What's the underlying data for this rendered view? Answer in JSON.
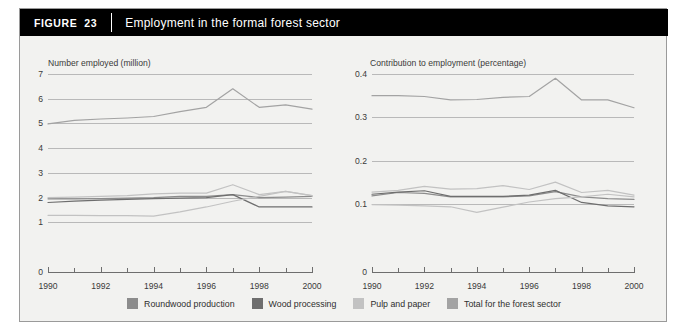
{
  "figure": {
    "tag": "FIGURE",
    "number": "23",
    "title": "Employment in the formal forest sector"
  },
  "legend": {
    "items": [
      {
        "label": "Roundwood production",
        "color": "#8c8c8c"
      },
      {
        "label": "Wood processing",
        "color": "#6e6e6e"
      },
      {
        "label": "Pulp and paper",
        "color": "#c2c2c2"
      },
      {
        "label": "Total for the forest sector",
        "color": "#a3a3a3"
      }
    ]
  },
  "chart_data": [
    {
      "type": "line",
      "id": "number-employed",
      "title": "Number employed (million)",
      "xlabel": "",
      "ylabel": "Number employed (million)",
      "x": [
        1990,
        1991,
        1992,
        1993,
        1994,
        1995,
        1996,
        1997,
        1998,
        1999,
        2000
      ],
      "xlim": [
        1990,
        2000
      ],
      "ylim": [
        0,
        7
      ],
      "yticks": [
        0,
        1,
        2,
        3,
        4,
        5,
        6,
        7
      ],
      "xticks": [
        1990,
        1991,
        1992,
        1993,
        1994,
        1995,
        1996,
        1997,
        1998,
        1999,
        2000
      ],
      "xticklabels": [
        "1990",
        "",
        "1992",
        "",
        "1994",
        "",
        "1996",
        "",
        "1998",
        "",
        "2000"
      ],
      "grid": true,
      "series": [
        {
          "name": "Roundwood production",
          "color": "#8c8c8c",
          "values": [
            1.95,
            1.95,
            1.96,
            1.98,
            2.0,
            2.05,
            2.05,
            2.12,
            2.0,
            2.02,
            2.05
          ]
        },
        {
          "name": "Wood processing",
          "color": "#6e6e6e",
          "values": [
            1.8,
            1.86,
            1.9,
            1.93,
            1.96,
            1.98,
            2.0,
            2.12,
            1.62,
            1.62,
            1.62
          ]
        },
        {
          "name": "Pulp and paper",
          "color": "#c2c2c2",
          "values": [
            1.28,
            1.28,
            1.27,
            1.27,
            1.25,
            1.42,
            1.62,
            1.85,
            2.05,
            2.25,
            2.08
          ]
        },
        {
          "name": "Total for the forest sector",
          "color": "#a3a3a3",
          "values": [
            4.98,
            5.12,
            5.18,
            5.22,
            5.28,
            5.48,
            5.65,
            6.4,
            5.65,
            5.75,
            5.58
          ]
        }
      ],
      "secondary_cluster": [
        {
          "name": "Pulp and paper upper",
          "color": "#c2c2c2",
          "values": [
            2.0,
            2.02,
            2.05,
            2.08,
            2.15,
            2.18,
            2.18,
            2.52,
            2.12,
            2.25,
            2.08
          ]
        }
      ]
    },
    {
      "type": "line",
      "id": "contribution-to-employment",
      "title": "Contribution to employment (percentage)",
      "xlabel": "",
      "ylabel": "Contribution to employment (percentage)",
      "x": [
        1990,
        1991,
        1992,
        1993,
        1994,
        1995,
        1996,
        1997,
        1998,
        1999,
        2000
      ],
      "xlim": [
        1990,
        2000
      ],
      "ylim": [
        0,
        0.4
      ],
      "yticks": [
        0,
        0.1,
        0.2,
        0.3,
        0.4
      ],
      "xticks": [
        1990,
        1991,
        1992,
        1993,
        1994,
        1995,
        1996,
        1997,
        1998,
        1999,
        2000
      ],
      "xticklabels": [
        "1990",
        "",
        "1992",
        "",
        "1994",
        "",
        "1996",
        "",
        "1998",
        "",
        "2000"
      ],
      "grid": true,
      "series": [
        {
          "name": "Roundwood production",
          "color": "#8c8c8c",
          "values": [
            0.118,
            0.126,
            0.124,
            0.116,
            0.116,
            0.116,
            0.118,
            0.128,
            0.116,
            0.112,
            0.11
          ]
        },
        {
          "name": "Wood processing",
          "color": "#6e6e6e",
          "values": [
            0.122,
            0.127,
            0.13,
            0.117,
            0.117,
            0.117,
            0.12,
            0.131,
            0.103,
            0.095,
            0.093
          ]
        },
        {
          "name": "Pulp and paper",
          "color": "#c2c2c2",
          "values": [
            0.098,
            0.097,
            0.095,
            0.093,
            0.08,
            0.092,
            0.104,
            0.112,
            0.116,
            0.122,
            0.116
          ]
        },
        {
          "name": "Total for the forest sector",
          "color": "#a3a3a3",
          "values": [
            0.35,
            0.35,
            0.348,
            0.34,
            0.341,
            0.346,
            0.348,
            0.39,
            0.34,
            0.34,
            0.322
          ]
        }
      ],
      "secondary_cluster": [
        {
          "name": "Pulp and paper upper",
          "color": "#c2c2c2",
          "values": [
            0.127,
            0.131,
            0.14,
            0.134,
            0.135,
            0.142,
            0.133,
            0.15,
            0.126,
            0.131,
            0.12
          ]
        }
      ]
    }
  ]
}
